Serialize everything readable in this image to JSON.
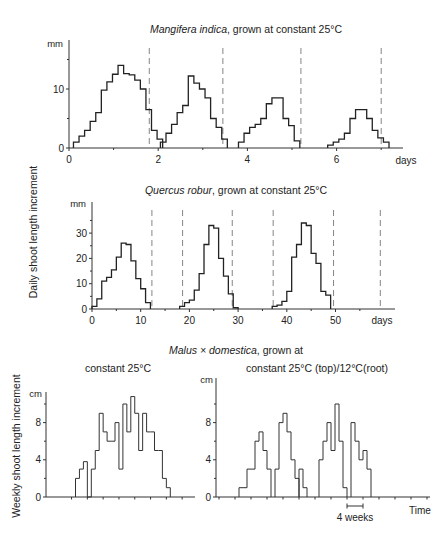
{
  "figure": {
    "shared_ylabel_daily": "Daily shoot length increment",
    "shared_ylabel_weekly": "Weekly shoot length increment"
  },
  "chart_data": [
    {
      "id": "mangifera",
      "type": "step",
      "title_italic": "Mangifera indica",
      "title_rest": ", grown at constant 25°C",
      "xlabel": "days",
      "ylabel_unit": "mm",
      "xticks": [
        0,
        2,
        4,
        6
      ],
      "yticks": [
        0,
        10
      ],
      "xlim": [
        0,
        8
      ],
      "ylim": [
        0,
        16
      ],
      "dashed_lines_x": [
        1.8,
        3.45,
        5.2,
        7.0
      ],
      "step_width": 0.125,
      "series": [
        {
          "start": 0.1,
          "values": [
            1,
            2,
            3,
            4.5,
            6,
            9.8,
            11.2,
            12.5,
            14,
            12.6,
            12.4,
            11.5,
            10,
            6.5,
            3,
            1.5
          ]
        },
        {
          "start": 2.05,
          "values": [
            1,
            2.5,
            4,
            6,
            7.2,
            12.2,
            11,
            10,
            8.5,
            5,
            3.5,
            1.5
          ]
        },
        {
          "start": 3.8,
          "values": [
            1,
            2.5,
            3.5,
            4,
            5,
            7.5,
            8.5,
            8.5,
            5,
            3.8,
            1.2
          ]
        },
        {
          "start": 5.8,
          "values": [
            0.5,
            1,
            1.5,
            2.5,
            5,
            6.5,
            6.5,
            5,
            3,
            1.7,
            1
          ]
        }
      ]
    },
    {
      "id": "quercus",
      "type": "step",
      "title_italic": "Quercus robur",
      "title_rest": ", grown at constant 25°C",
      "xlabel": "days",
      "ylabel_unit": "mm",
      "xticks": [
        0,
        10,
        20,
        30,
        40,
        50
      ],
      "yticks": [
        0,
        10,
        20,
        30
      ],
      "xlim": [
        0,
        60
      ],
      "ylim": [
        0,
        38
      ],
      "dashed_lines_x": [
        12.3,
        18.6,
        28.8,
        37.2,
        49.6,
        59.2
      ],
      "step_width": 1,
      "series": [
        {
          "start": 0,
          "values": [
            1,
            4,
            11,
            12.5,
            15.5,
            20.5,
            26,
            25.5,
            19,
            12,
            8,
            2.5
          ]
        },
        {
          "start": 18,
          "values": [
            1,
            2.5,
            3.5,
            7.5,
            14,
            25.5,
            33,
            32,
            20,
            13,
            6,
            0.5
          ]
        },
        {
          "start": 37,
          "values": [
            1,
            1.5,
            3,
            7,
            20.5,
            25.5,
            34,
            33,
            22,
            18,
            7,
            5.5
          ]
        }
      ]
    },
    {
      "id": "malus-constant",
      "type": "step",
      "group_title_italic": "Malus × domestica",
      "group_title_rest": ", grown at",
      "title": "constant 25°C",
      "xlabel": "",
      "ylabel_unit": "cm",
      "yticks": [
        0,
        4,
        8
      ],
      "ylim": [
        0,
        11
      ],
      "step_width_weeks": 1,
      "series": [
        {
          "start": 0,
          "values": [
            2,
            3,
            3.8,
            0,
            3,
            5,
            9,
            7,
            6,
            6,
            8,
            3,
            10,
            7,
            10.8,
            9,
            5,
            9,
            7,
            7,
            5,
            5,
            2,
            1
          ]
        }
      ]
    },
    {
      "id": "malus-split",
      "type": "step",
      "title": "constant 25°C (top)/12°C(root)",
      "xlabel": "Time",
      "scale_bar_label": "4 weeks",
      "ylabel_unit": "cm",
      "yticks": [
        0,
        4,
        8
      ],
      "ylim": [
        0,
        11
      ],
      "step_width_weeks": 1,
      "series": [
        {
          "start": 4,
          "values": [
            1,
            1,
            3,
            3,
            6,
            7,
            5,
            3
          ]
        },
        {
          "start": 13,
          "values": [
            3,
            8,
            9,
            7,
            4,
            2
          ]
        },
        {
          "start": 19,
          "values": [
            3,
            1
          ]
        },
        {
          "start": 24,
          "values": [
            4,
            6,
            8,
            5,
            10,
            6,
            1
          ]
        },
        {
          "start": 32,
          "values": [
            8,
            6,
            4,
            5,
            3
          ]
        }
      ]
    }
  ]
}
